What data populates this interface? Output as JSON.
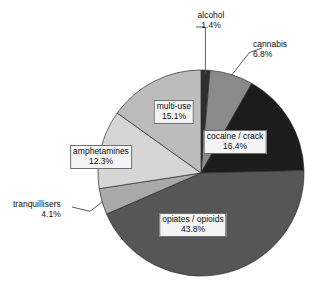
{
  "chart_data": {
    "type": "pie",
    "title": "",
    "subtitle": "",
    "xlabel": "",
    "ylabel": "",
    "legend_position": "none",
    "grid": false,
    "value_unit": "percent",
    "start_angle_deg": 0,
    "direction": "clockwise",
    "categories": [
      "alcohol",
      "cannabis",
      "cocaine / crack",
      "opiates / opioids",
      "tranquillisers",
      "amphetamines",
      "multi-use"
    ],
    "values": [
      1.4,
      6.8,
      16.4,
      43.8,
      4.1,
      12.3,
      15.1
    ],
    "value_labels": [
      "1.4%",
      "6.8%",
      "16.4%",
      "43.8%",
      "4.1%",
      "12.3%",
      "15.1%"
    ],
    "colors": [
      "#2e2e2e",
      "#8a8a8a",
      "#1c1c1c",
      "#565656",
      "#a9a9a9",
      "#d6d6d6",
      "#bcbcbc"
    ],
    "total": 99.9,
    "slices": [
      {
        "label": "alcohol",
        "value": 1.4,
        "value_label": "1.4%",
        "color": "#2e2e2e",
        "label_placement": "outside",
        "has_leader_line": true
      },
      {
        "label": "cannabis",
        "value": 6.8,
        "value_label": "6.8%",
        "color": "#8a8a8a",
        "label_placement": "outside",
        "has_leader_line": true
      },
      {
        "label": "cocaine / crack",
        "value": 16.4,
        "value_label": "16.4%",
        "color": "#1c1c1c",
        "label_placement": "inside",
        "has_leader_line": false
      },
      {
        "label": "opiates / opioids",
        "value": 43.8,
        "value_label": "43.8%",
        "color": "#565656",
        "label_placement": "inside",
        "has_leader_line": false
      },
      {
        "label": "tranquillisers",
        "value": 4.1,
        "value_label": "4.1%",
        "color": "#a9a9a9",
        "label_placement": "outside",
        "has_leader_line": true
      },
      {
        "label": "amphetamines",
        "value": 12.3,
        "value_label": "12.3%",
        "color": "#d6d6d6",
        "label_placement": "inside",
        "has_leader_line": false
      },
      {
        "label": "multi-use",
        "value": 15.1,
        "value_label": "15.1%",
        "color": "#bcbcbc",
        "label_placement": "inside",
        "has_leader_line": false
      }
    ]
  },
  "geometry": {
    "center_x": 201,
    "center_y": 173,
    "radius": 103,
    "slice_outline_color": "#2b2b2b",
    "leader_color": "#4a4a4a",
    "background": "#ffffff"
  },
  "labels": {
    "alcohol": {
      "name": "alcohol",
      "pct": "1.4%",
      "left": 211,
      "top": 10,
      "align": "align-center"
    },
    "cannabis": {
      "name": "cannabis",
      "pct": "6.8%",
      "left": 253,
      "top": 38,
      "align": "align-left"
    },
    "cocaine": {
      "name": "cocaine / crack",
      "pct": "16.4%",
      "left": 235,
      "top": 130,
      "align": "align-center"
    },
    "opiates": {
      "name": "opiates / opioids",
      "pct": "43.8%",
      "left": 160,
      "top": 213,
      "align": "align-center"
    },
    "tranquillisers": {
      "name": "tranquillisers",
      "pct": "4.1%",
      "left": 13,
      "top": 199,
      "align": "align-right"
    },
    "amphetamines": {
      "name": "amphetamines",
      "pct": "12.3%",
      "left": 101,
      "top": 145,
      "align": "align-center"
    },
    "multiuse": {
      "name": "multi-use",
      "pct": "15.1%",
      "left": 152,
      "top": 100,
      "align": "align-center"
    }
  }
}
